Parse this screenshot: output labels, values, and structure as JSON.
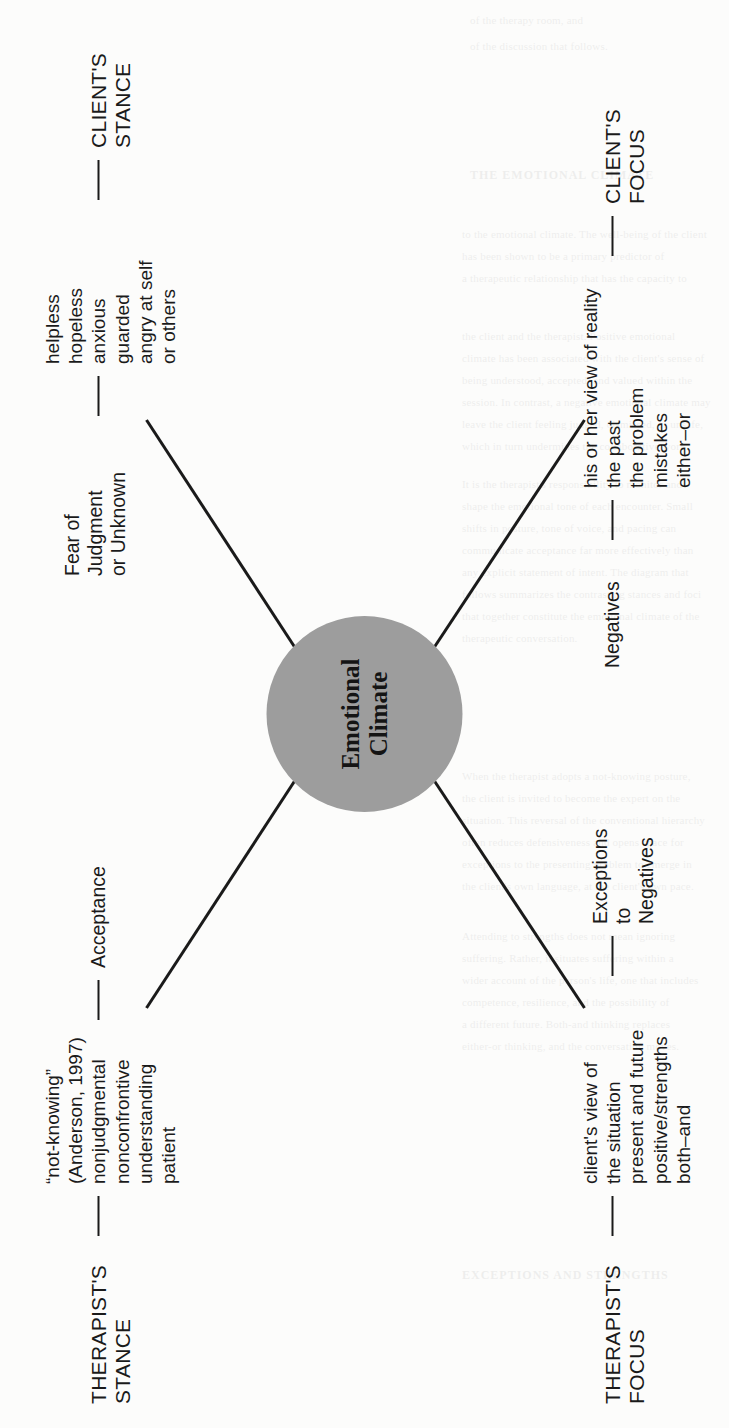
{
  "diagram": {
    "type": "concept-map",
    "rotation_note": "figure is printed rotated 90 degrees counter-clockwise on the page",
    "hub": {
      "line1": "Emotional",
      "line2": "Climate",
      "fill_color": "#9d9d9d",
      "text_color": "#141414"
    },
    "quadrants": [
      {
        "id": "therapists-stance",
        "heading": [
          "THERAPIST'S",
          "STANCE"
        ],
        "mid_label": [
          "Acceptance"
        ],
        "leaves": [
          "“not-knowing”",
          "(Anderson, 1997)",
          "nonjudgmental",
          "nonconfrontive",
          "understanding",
          "patient"
        ]
      },
      {
        "id": "clients-stance",
        "heading": [
          "CLIENT'S",
          "STANCE"
        ],
        "mid_label": [
          "Fear of",
          "Judgment",
          "or Unknown"
        ],
        "leaves": [
          "helpless",
          "hopeless",
          "anxious",
          "guarded",
          "angry at self",
          "or others"
        ]
      },
      {
        "id": "therapists-focus",
        "heading": [
          "THERAPIST'S",
          "FOCUS"
        ],
        "mid_label": [
          "Exceptions",
          "to",
          "Negatives"
        ],
        "leaves": [
          "client's view of",
          "the situation",
          "present and future",
          "positive/strengths",
          "both–and"
        ]
      },
      {
        "id": "clients-focus",
        "heading": [
          "CLIENT'S",
          "FOCUS"
        ],
        "mid_label": [
          "Negatives"
        ],
        "leaves": [
          "his or her view of reality",
          "the past",
          "the problem",
          "mistakes",
          "either–or"
        ]
      }
    ]
  },
  "bleed_through": [
    "of the therapy room, and",
    "of the discussion that follows.",
    "THE EMOTIONAL CLIMATE",
    "to the emotional climate. The well-being of the client",
    "has been shown to be a primary predictor of",
    "a therapeutic relationship that has the capacity to",
    "the client and the therapist. Positive emotional",
    "climate has been associated with the client's sense of",
    "being understood, accepted, and valued within the",
    "session. In contrast, a negative emotional climate may",
    "leave the client feeling judged, dismissed, or unsafe,",
    "which in turn undermines the collaborative work.",
    "It is the therapist's responsibility to monitor and",
    "shape the emotional tone of each encounter. Small",
    "shifts in posture, tone of voice, and pacing can",
    "communicate acceptance far more effectively than",
    "any explicit statement of intent. The diagram that",
    "follows summarizes the contrasting stances and foci",
    "that together constitute the emotional climate of the",
    "therapeutic conversation.",
    "When the therapist adopts a not-knowing posture,",
    "the client is invited to become the expert on the",
    "situation. This reversal of the conventional hierarchy",
    "often reduces defensiveness and opens space for",
    "exceptions to the presenting problem to emerge in",
    "the client's own language, at the client's own pace.",
    "Attending to strengths does not mean ignoring",
    "suffering. Rather, it situates suffering within a",
    "wider account of the person's life, one that includes",
    "competence, resilience, and the possibility of",
    "a different future. Both-and thinking replaces",
    "either-or thinking, and the conversation moves.",
    "EXCEPTIONS AND STRENGTHS"
  ]
}
